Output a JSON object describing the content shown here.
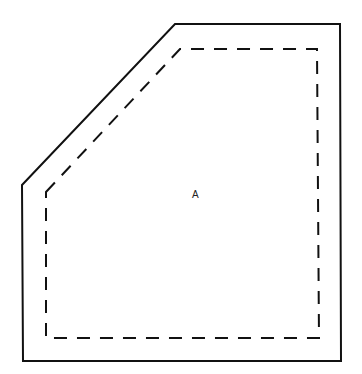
{
  "diagram": {
    "type": "polygon-with-inset",
    "outer_outline": {
      "style": "solid",
      "color": "#111111",
      "points": [
        [
          22,
          185
        ],
        [
          175,
          24
        ],
        [
          340,
          24
        ],
        [
          341,
          361
        ],
        [
          23,
          361
        ]
      ]
    },
    "inner_outline": {
      "style": "dashed",
      "color": "#111111",
      "points": [
        [
          46,
          192
        ],
        [
          180,
          49
        ],
        [
          317,
          49
        ],
        [
          319,
          338
        ],
        [
          46,
          338
        ]
      ]
    },
    "region_label": {
      "text": "A",
      "x": 192,
      "y": 189
    }
  }
}
